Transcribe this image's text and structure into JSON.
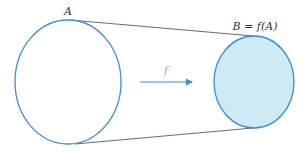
{
  "diagram": {
    "type": "function-mapping",
    "domain_set": {
      "label": "A",
      "fill": "#ffffff",
      "stroke": "#3a8fd6"
    },
    "image_set": {
      "label": "B = f(A)",
      "fill": "#cdeaf5",
      "stroke": "#3a8fd6"
    },
    "mapping": {
      "label": "f",
      "arrow_color": "#3a8fd6"
    },
    "connector_color": "#444444"
  }
}
